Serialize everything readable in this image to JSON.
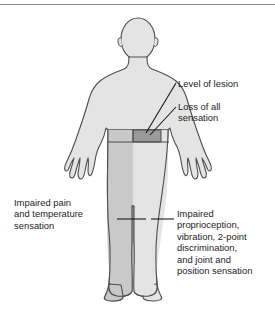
{
  "labels": {
    "level_of_lesion": "Level of lesion",
    "loss_of_all_sensation": "Loss of all\nsensation",
    "impaired_pain_and_temperature": "Impaired pain\nand temperature\nsensation",
    "impaired_proprioception": "Impaired\nproprioception,\nvibration, 2-point\ndiscrimination,\nand joint and\nposition sensation"
  },
  "colors": {
    "body_fill_light": "#e4e4e4",
    "body_fill_medium": "#c9c9c9",
    "lesion_block_dark": "#9a9a9a",
    "outline": "#4d4d4d",
    "leader_line": "#1b1b1b",
    "text": "#1b1b1b",
    "top_rule": "#8d8d8d",
    "background": "#ffffff"
  },
  "regions": [
    {
      "name": "loss-of-all-sensation-band",
      "shade": "dark",
      "description": "dark gray block at waist level on viewer-right side marking the level of lesion"
    },
    {
      "name": "impaired-pain-temperature-region",
      "shade": "medium",
      "description": "medium gray shading over viewer-left leg and lower trunk"
    },
    {
      "name": "impaired-proprioception-region",
      "shade": "light",
      "description": "light gray shading over viewer-right leg below the lesion"
    }
  ]
}
